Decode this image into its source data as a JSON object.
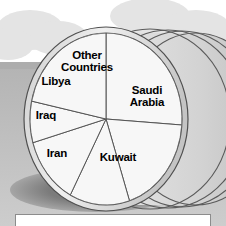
{
  "chart_data": {
    "type": "pie",
    "title": "",
    "xlabel": "",
    "ylabel": "",
    "legend": "none",
    "labels_on_slices": true,
    "categories": [
      "Saudi Arabia",
      "Kuwait",
      "Iran",
      "Iraq",
      "Libya",
      "Other Countries"
    ],
    "values": [
      26,
      19,
      13,
      13,
      8,
      21
    ],
    "slices": [
      {
        "label": "Saudi Arabia",
        "value": 26,
        "start_deg": 0,
        "end_deg": 94
      },
      {
        "label": "Kuwait",
        "value": 19,
        "start_deg": 94,
        "end_deg": 162
      },
      {
        "label": "Iran",
        "value": 13,
        "start_deg": 162,
        "end_deg": 208
      },
      {
        "label": "Iraq",
        "value": 13,
        "start_deg": 208,
        "end_deg": 254
      },
      {
        "label": "Libya",
        "value": 8,
        "start_deg": 254,
        "end_deg": 282
      },
      {
        "label": "Other Countries",
        "value": 21,
        "start_deg": 282,
        "end_deg": 360
      }
    ]
  },
  "labels": {
    "saudi_arabia": "Saudi\nArabia",
    "kuwait": "Kuwait",
    "iran": "Iran",
    "iraq": "Iraq",
    "libya": "Libya",
    "other_countries": "Other\nCountries"
  },
  "colors": {
    "sky": "#ffffff",
    "cloud": "#e2e2e2",
    "ground": "#bdbdbd",
    "ground_far": "#a9a9a9",
    "shadow": "#6e6e6e",
    "barrel_face": "#f4f4f4",
    "barrel_rim": "#d6d6d6",
    "barrel_band": "#cfcfcf",
    "outline": "#4a4a4a",
    "slice_fill": "#f7f7f7",
    "slice_line": "#555555",
    "text": "#000000",
    "box_fill": "#ffffff",
    "box_border": "#8c8c8c"
  },
  "geometry": {
    "face_center_x": 106,
    "face_center_y": 119,
    "face_radius_x": 82,
    "face_radius_y": 92,
    "ring_count": 4
  }
}
